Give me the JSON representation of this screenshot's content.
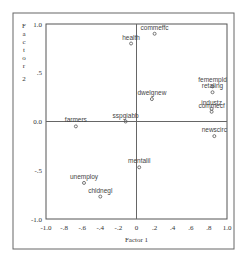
{
  "chart_data": {
    "type": "scatter",
    "title": "",
    "xlabel": "Factor 1",
    "ylabel": "Factor 2",
    "xlim": [
      -1.0,
      1.0
    ],
    "ylim": [
      -1.0,
      1.0
    ],
    "x_ticks": [
      "-1.0",
      "-.8",
      "-.6",
      "-.4",
      "-.2",
      "0",
      ".2",
      ".4",
      ".6",
      ".8",
      "1.0"
    ],
    "x_tick_values": [
      -1.0,
      -0.8,
      -0.6,
      -0.4,
      -0.2,
      0.0,
      0.2,
      0.4,
      0.6,
      0.8,
      1.0
    ],
    "y_ticks": [
      "1.0",
      ".5",
      "0.0",
      "-.5",
      "-1.0"
    ],
    "y_tick_values": [
      1.0,
      0.5,
      0.0,
      -0.5,
      -1.0
    ],
    "grid": false,
    "reference_lines": {
      "x": 0.0,
      "y": 0.0
    },
    "legend": null,
    "points": [
      {
        "label": "health",
        "x": -0.06,
        "y": 0.8
      },
      {
        "label": "commeffc",
        "x": 0.2,
        "y": 0.9
      },
      {
        "label": "dwelgnew",
        "x": 0.17,
        "y": 0.23
      },
      {
        "label": "femempld",
        "x": 0.84,
        "y": 0.36
      },
      {
        "label": "retaling",
        "x": 0.84,
        "y": 0.3
      },
      {
        "label": "industz",
        "x": 0.83,
        "y": 0.13
      },
      {
        "label": "commecf",
        "x": 0.83,
        "y": 0.1
      },
      {
        "label": "newscirc",
        "x": 0.86,
        "y": -0.15
      },
      {
        "label": "farmers",
        "x": -0.67,
        "y": -0.05
      },
      {
        "label": "sspgiabb",
        "x": -0.12,
        "y": 0.0
      },
      {
        "label": "mentalil",
        "x": 0.03,
        "y": -0.47
      },
      {
        "label": "unemploy",
        "x": -0.58,
        "y": -0.63
      },
      {
        "label": "chldnegl",
        "x": -0.4,
        "y": -0.77
      }
    ]
  },
  "layout": {
    "outer_frame": {
      "x": 13,
      "y": 13,
      "w": 221,
      "h": 236
    },
    "plot": {
      "left": 46,
      "right": 227,
      "top": 24,
      "bottom": 219
    }
  },
  "colors": {
    "frame": "#555555",
    "axis": "#555555",
    "marker": "#555555",
    "text": "#333333"
  }
}
